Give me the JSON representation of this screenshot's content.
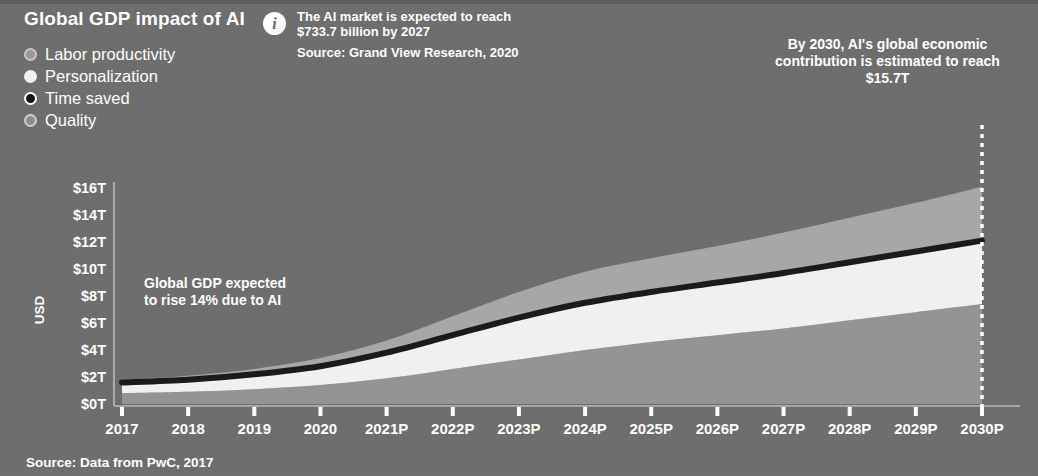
{
  "header": {
    "title": "Global GDP impact of AI"
  },
  "legend": {
    "items": [
      {
        "label": "Labor productivity",
        "color": "#a8a8a8",
        "marker": "legend-dot-labor-productivity"
      },
      {
        "label": "Personalization",
        "color": "#f2f2f0",
        "marker": "legend-dot-personalization"
      },
      {
        "label": "Time saved",
        "color": "#1a1a1a",
        "marker": "legend-dot-time-saved"
      },
      {
        "label": "Quality",
        "color": "#949494",
        "marker": "legend-dot-quality"
      }
    ]
  },
  "info": {
    "icon": "info-icon",
    "text": "The AI market is expected to reach $733.7 billion by 2027",
    "source": "Source: Grand View Research, 2020"
  },
  "callout": {
    "text": "By 2030, AI's global economic contribution is estimated to reach $15.7T"
  },
  "annotation": {
    "line1": "Global GDP expected",
    "line2": "to rise 14% due to AI"
  },
  "footer": {
    "source": "Source: Data from PwC, 2017"
  },
  "colors": {
    "background": "#6e6e6e",
    "labor_productivity": "#a8a8a8",
    "personalization": "#f2f2f0",
    "time_saved": "#1a1a1a",
    "quality": "#949494",
    "axis": "#bdbdbd",
    "text": "#ffffff"
  },
  "chart_data": {
    "type": "area",
    "title": "Global GDP impact of AI",
    "xlabel": "",
    "ylabel": "USD",
    "stacked": true,
    "grid": false,
    "legend_position": "top-left",
    "ylim": [
      0,
      16
    ],
    "ytick_labels": [
      "$16T",
      "$14T",
      "$12T",
      "$10T",
      "$8T",
      "$6T",
      "$4T",
      "$2T",
      "$0T"
    ],
    "ytick_values": [
      16,
      14,
      12,
      10,
      8,
      6,
      4,
      2,
      0
    ],
    "categories": [
      "2017",
      "2018",
      "2019",
      "2020",
      "2021P",
      "2022P",
      "2023P",
      "2024P",
      "2025P",
      "2026P",
      "2027P",
      "2028P",
      "2029P",
      "2030P"
    ],
    "series": [
      {
        "name": "Quality",
        "color": "#949494",
        "values": [
          0.8,
          0.9,
          1.1,
          1.4,
          1.9,
          2.6,
          3.3,
          4.0,
          4.6,
          5.1,
          5.6,
          6.2,
          6.8,
          7.4
        ]
      },
      {
        "name": "Personalization",
        "color": "#f2f2f0",
        "values": [
          0.7,
          0.8,
          1.0,
          1.3,
          1.8,
          2.4,
          3.0,
          3.4,
          3.6,
          3.8,
          4.0,
          4.2,
          4.4,
          4.6
        ]
      },
      {
        "name": "Time saved",
        "color": "#1a1a1a",
        "values": [
          0.1,
          0.1,
          0.1,
          0.1,
          0.1,
          0.1,
          0.1,
          0.1,
          0.1,
          0.1,
          0.1,
          0.1,
          0.1,
          0.1
        ]
      },
      {
        "name": "Labor productivity",
        "color": "#a8a8a8",
        "values": [
          0.2,
          0.3,
          0.4,
          0.6,
          0.9,
          1.4,
          1.9,
          2.3,
          2.5,
          2.7,
          3.0,
          3.3,
          3.6,
          4.0
        ]
      }
    ],
    "totals": [
      1.8,
      2.1,
      2.6,
      3.4,
      4.7,
      6.5,
      8.3,
      9.8,
      10.8,
      11.7,
      12.7,
      13.8,
      14.9,
      16.1
    ],
    "cumulative_time_saved_line": [
      1.6,
      1.8,
      2.2,
      2.8,
      3.8,
      5.1,
      6.4,
      7.5,
      8.3,
      9.0,
      9.7,
      10.5,
      11.3,
      12.1
    ],
    "marker_year": "2030P",
    "marker_value": 15.7
  }
}
